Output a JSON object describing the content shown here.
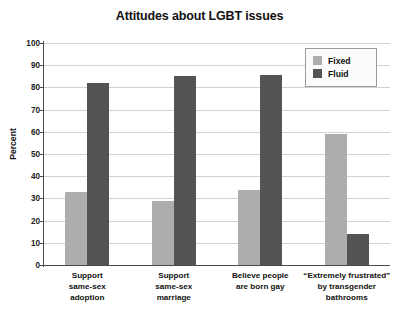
{
  "chart_data": {
    "type": "bar",
    "title": "Attitudes about LGBT issues",
    "xlabel": "",
    "ylabel": "Percent",
    "ylim": [
      0,
      100
    ],
    "ytick_step": 10,
    "yticks": [
      100,
      90,
      80,
      70,
      60,
      50,
      40,
      30,
      20,
      10,
      0
    ],
    "grid": true,
    "legend_position": "top-right",
    "categories": [
      "Support same-sex adoption",
      "Support same-sex marriage",
      "Believe people are born gay",
      "“Extremely frustrated” by transgender bathrooms"
    ],
    "category_lines": [
      [
        "Support",
        "same-sex",
        "adoption"
      ],
      [
        "Support",
        "same-sex",
        "marriage"
      ],
      [
        "Believe people",
        "are born gay"
      ],
      [
        "“Extremely frustrated”",
        "by transgender",
        "bathrooms"
      ]
    ],
    "series": [
      {
        "name": "Fixed",
        "color": "#ADADAD",
        "values": [
          33,
          29,
          34,
          59
        ]
      },
      {
        "name": "Fluid",
        "color": "#545454",
        "values": [
          82,
          85,
          85.5,
          14
        ]
      }
    ]
  },
  "legend": {
    "entries": [
      {
        "label": "Fixed",
        "color": "#ADADAD"
      },
      {
        "label": "Fluid",
        "color": "#545454"
      }
    ]
  },
  "colors": {
    "fixed": "#ADADAD",
    "fluid": "#545454",
    "gridline": "#d2d2d2",
    "axis": "#4a4a4a",
    "text": "#111111",
    "background": "#ffffff"
  }
}
